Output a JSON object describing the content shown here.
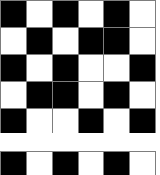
{
  "pattern": {
    "title": "Checkerboard Grid Pattern",
    "type": "binary-grid",
    "columns": 6,
    "rows_total": 6,
    "cell_size_px": 26,
    "colors": {
      "filled": "#000000",
      "empty": "#ffffff",
      "gridline": "#7d7d7d",
      "background": "#ffffff"
    },
    "legend": {
      "filled_label": "filled",
      "empty_label": "empty"
    },
    "gap_after_row": 5,
    "gap_height_px": 18,
    "rows": [
      {
        "index": 1,
        "cells": [
          "black",
          "white",
          "black",
          "white",
          "black",
          "white"
        ]
      },
      {
        "index": 2,
        "cells": [
          "white",
          "black",
          "white",
          "black",
          "black",
          "white"
        ]
      },
      {
        "index": 3,
        "cells": [
          "black",
          "white",
          "black",
          "white",
          "white",
          "black"
        ]
      },
      {
        "index": 4,
        "cells": [
          "white",
          "black",
          "black",
          "white",
          "black",
          "white"
        ]
      },
      {
        "index": 5,
        "cells": [
          "black",
          "white",
          "white",
          "black",
          "white",
          "black"
        ]
      },
      {
        "index": 6,
        "cells": [
          "black",
          "white",
          "black",
          "white",
          "black",
          "white"
        ]
      }
    ]
  }
}
